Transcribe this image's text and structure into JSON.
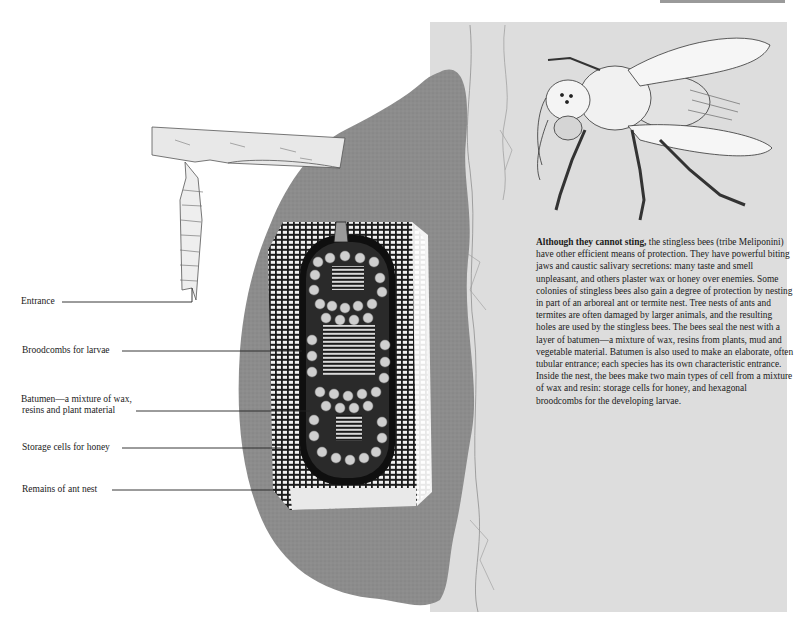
{
  "figure": {
    "colors": {
      "background": "#ffffff",
      "tree_trunk": "#dddddd",
      "ant_nest": "#8c8c8c",
      "batumen_layer": "#2a2a2a",
      "branch": "#e8e8e8",
      "text": "#1b1b1b"
    }
  },
  "labels": [
    {
      "id": "entrance",
      "text": "Entrance"
    },
    {
      "id": "broodcombs",
      "text": "Broodcombs for larvae"
    },
    {
      "id": "batumen_line1",
      "text": "Batumen—a mixture of wax,"
    },
    {
      "id": "batumen_line2",
      "text": "resins and plant material"
    },
    {
      "id": "storage",
      "text": "Storage cells for honey"
    },
    {
      "id": "remains",
      "text": "Remains of ant nest"
    }
  ],
  "caption": {
    "lead": "Although they cannot sting,",
    "body": " the stingless bees (tribe Meliponini) have other efficient means of protection. They have powerful biting jaws and caustic salivary secretions: many taste and smell unpleasant, and others plaster wax or honey over enemies. Some colonies of stingless bees also gain a degree of protection by nesting in part of an arboreal ant or termite nest. Tree nests of ants and termites are often damaged by larger animals, and the resulting holes are used by the stingless bees. The bees seal the nest with a layer of batumen—a mixture of wax, resins from plants, mud and vegetable material. Batumen is also used to make an elaborate, often tubular entrance; each species has its own characteristic entrance. Inside the nest, the bees make two main types of cell from a mixture of wax and resin: storage cells for honey, and hexagonal broodcombs for the developing larvae."
  },
  "illustration": {
    "bee": "stingless-bee-illustration",
    "nest": "nest-cross-section",
    "branch": "tree-branch",
    "trunk": "tree-trunk"
  }
}
